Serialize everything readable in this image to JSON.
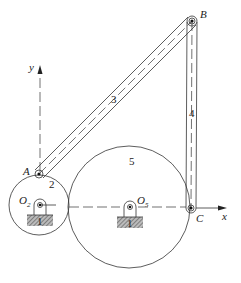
{
  "diagram": {
    "type": "planar-mechanism",
    "points": {
      "A": {
        "label": "A",
        "x": 39,
        "y": 174
      },
      "B": {
        "label": "B",
        "x": 192,
        "y": 21
      },
      "C": {
        "label": "C",
        "x": 191,
        "y": 208
      },
      "O2": {
        "label": "O",
        "subscript": "2",
        "x": 40,
        "y": 205
      },
      "O5": {
        "label": "O",
        "subscript": "5",
        "x": 130,
        "y": 207
      }
    },
    "links": {
      "ground": "1",
      "gear2": "2",
      "coupler": "3",
      "rocker": "4",
      "gear5": "5"
    },
    "axes": {
      "x": "x",
      "y": "y"
    },
    "gears": [
      {
        "name": "gear-2",
        "cx": 39,
        "cy": 205,
        "r": 30
      },
      {
        "name": "gear-5",
        "cx": 129,
        "cy": 207,
        "r": 61
      }
    ],
    "colors": {
      "stroke": "#333333",
      "hatch": "#666666",
      "background": "#ffffff"
    }
  }
}
